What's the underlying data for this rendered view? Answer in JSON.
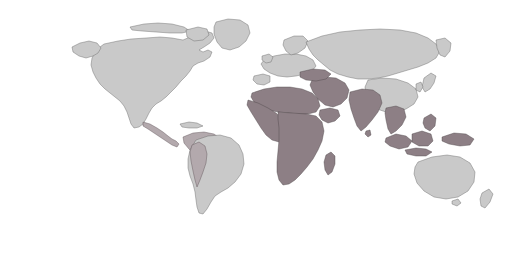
{
  "map": {
    "title": "World Map",
    "projection": "robinson",
    "graticule_interval_deg": 15,
    "colors": {
      "background": "#ffffff",
      "land_light": "#c9c9c9",
      "land_highlight": "#8d7f85",
      "land_mid": "#b3a9ad",
      "graticule": "#8f8f8f",
      "outline": "#111111",
      "text": "#1a1a1a"
    },
    "ocean_labels": [
      {
        "name": "arctic-ocean",
        "text": "ARCTIC OCEAN",
        "x": 318,
        "y": 17,
        "size": "small",
        "rotate": -7
      },
      {
        "name": "atlantic-ocean-line1",
        "text": "ATLANTIC",
        "x": 185,
        "y": 72,
        "size": "large",
        "rotate": 0
      },
      {
        "name": "atlantic-ocean-line2",
        "text": "OCEAN",
        "x": 191,
        "y": 96,
        "size": "large",
        "rotate": 0
      },
      {
        "name": "pacific-ocean-west-line1",
        "text": "PACIFIC",
        "x": 65,
        "y": 125,
        "size": "large",
        "rotate": 0
      },
      {
        "name": "pacific-ocean-west-line2",
        "text": "OCEAN",
        "x": 68,
        "y": 145,
        "size": "large",
        "rotate": 0
      },
      {
        "name": "pacific-ocean-east-line1",
        "text": "PACIFIC",
        "x": 453,
        "y": 104,
        "size": "large",
        "rotate": 0
      },
      {
        "name": "pacific-ocean-east-line2",
        "text": "OCEAN",
        "x": 456,
        "y": 126,
        "size": "large",
        "rotate": 0
      },
      {
        "name": "indian-ocean-line1",
        "text": "INDIAN",
        "x": 348,
        "y": 149,
        "size": "large",
        "rotate": 0
      },
      {
        "name": "indian-ocean-line2",
        "text": "OCEAN",
        "x": 346,
        "y": 169,
        "size": "large",
        "rotate": 0
      }
    ],
    "sea_labels": [
      {
        "name": "arabian-sea-line1",
        "text": "Arabian",
        "x": 339,
        "y": 117
      },
      {
        "name": "arabian-sea-line2",
        "text": "Sea",
        "x": 343,
        "y": 123
      },
      {
        "name": "bay-of-bengal-line1",
        "text": "Bay of",
        "x": 376,
        "y": 117
      },
      {
        "name": "bay-of-bengal-line2",
        "text": "Bengal",
        "x": 375,
        "y": 123
      }
    ],
    "reference_lines": [
      {
        "name": "arctic-circle",
        "text": "Arctic Circle",
        "lat": 66.5,
        "label_x": 254,
        "label_y": 36,
        "dashed": true
      },
      {
        "name": "tropic-of-cancer",
        "text": "Tropic of Cancer",
        "lat": 23.44,
        "label_x": 47,
        "label_y": 76,
        "dashed": true
      },
      {
        "name": "equator",
        "text": "Equator",
        "lat": 0,
        "label_x": 47,
        "label_y": 131,
        "dashed": false
      },
      {
        "name": "tropic-of-capricorn",
        "text": "Tropic of Capricorn",
        "lat": -23.44,
        "label_x": 214,
        "label_y": 184,
        "dashed": true
      }
    ],
    "latitude_labels": [
      {
        "name": "lat-60N",
        "text": "60°",
        "lat": 60,
        "x": 60,
        "y": 24
      },
      {
        "name": "lat-40N",
        "text": "40°",
        "lat": 40,
        "x": 41,
        "y": 72
      },
      {
        "name": "lat-20N",
        "text": "20°",
        "lat": 20,
        "x": 31,
        "y": 112
      },
      {
        "name": "lat-0",
        "text": "0°",
        "lat": 0,
        "x": 26,
        "y": 141
      },
      {
        "name": "lat-20S",
        "text": "20°",
        "lat": -20,
        "x": 31,
        "y": 176
      },
      {
        "name": "lat-40S",
        "text": "40°",
        "lat": -40,
        "x": 42,
        "y": 206
      }
    ],
    "longitude_labels": [
      {
        "name": "lon-180W",
        "text": "180°",
        "lon": -180
      },
      {
        "name": "lon-165W",
        "text": "165°",
        "lon": -165
      },
      {
        "name": "lon-150W",
        "text": "150°",
        "lon": -150
      },
      {
        "name": "lon-135W",
        "text": "135°",
        "lon": -135
      },
      {
        "name": "lon-120W",
        "text": "120°",
        "lon": -120
      },
      {
        "name": "lon-105W",
        "text": "105°",
        "lon": -105
      },
      {
        "name": "lon-90W",
        "text": "90°",
        "lon": -90
      },
      {
        "name": "lon-75W",
        "text": "75°",
        "lon": -75
      },
      {
        "name": "lon-60W",
        "text": "60°",
        "lon": -60
      },
      {
        "name": "lon-45W",
        "text": "45°",
        "lon": -45
      },
      {
        "name": "lon-30W",
        "text": "30°",
        "lon": -30
      },
      {
        "name": "lon-15W",
        "text": "15°",
        "lon": -15
      },
      {
        "name": "lon-0",
        "text": "0°",
        "lon": 0
      },
      {
        "name": "lon-15E",
        "text": "15°",
        "lon": 15
      },
      {
        "name": "lon-30E",
        "text": "30°",
        "lon": 30
      },
      {
        "name": "lon-45E",
        "text": "45°",
        "lon": 45
      },
      {
        "name": "lon-60E",
        "text": "60°",
        "lon": 60
      },
      {
        "name": "lon-75E",
        "text": "75°",
        "lon": 75
      },
      {
        "name": "lon-90E",
        "text": "90°",
        "lon": 90
      },
      {
        "name": "lon-105E",
        "text": "105°",
        "lon": 105
      },
      {
        "name": "lon-120E",
        "text": "120°",
        "lon": 120
      },
      {
        "name": "lon-135E",
        "text": "135°",
        "lon": 135
      },
      {
        "name": "lon-150E",
        "text": "150°",
        "lon": 150
      },
      {
        "name": "lon-165E",
        "text": "165°",
        "lon": 165
      },
      {
        "name": "lon-180E",
        "text": "180°",
        "lon": 180
      }
    ]
  }
}
